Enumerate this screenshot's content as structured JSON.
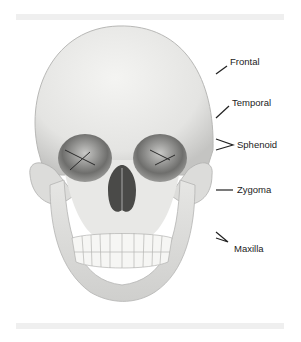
{
  "figure": {
    "labels": [
      {
        "text": "Frontal",
        "x": 230,
        "y": 56
      },
      {
        "text": "Temporal",
        "x": 232,
        "y": 97
      },
      {
        "text": "Sphenoid",
        "x": 237,
        "y": 139
      },
      {
        "text": "Zygoma",
        "x": 237,
        "y": 184
      },
      {
        "text": "Maxilla",
        "x": 234,
        "y": 243
      }
    ],
    "colors": {
      "band": "#efefef",
      "bone_light": "#efefed",
      "bone_mid": "#d2d2d0",
      "bone_dark": "#7a7a78",
      "label_text": "#222222"
    }
  }
}
